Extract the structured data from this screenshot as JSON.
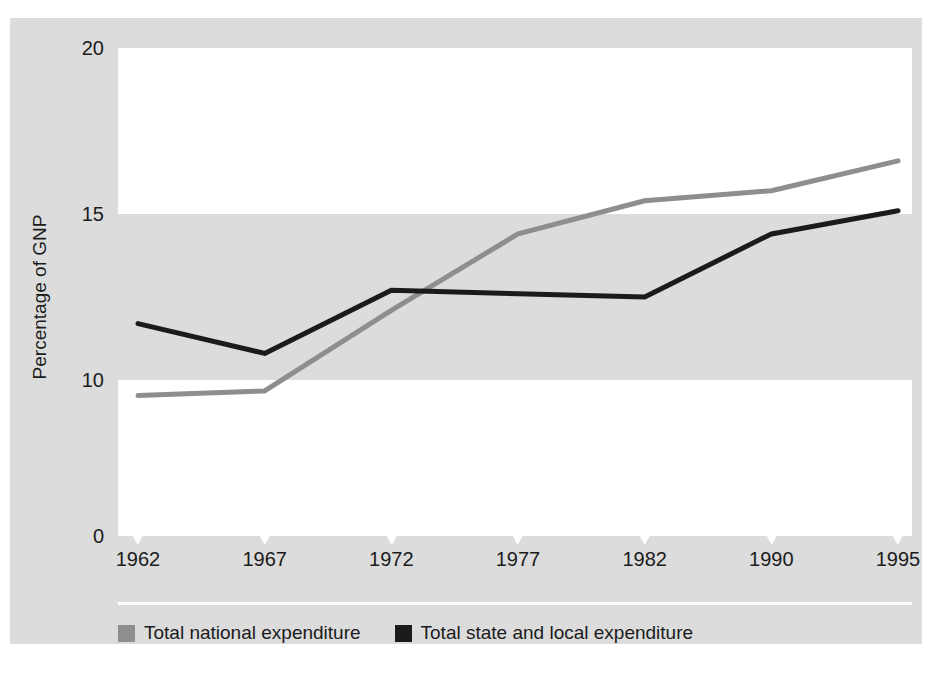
{
  "figure": {
    "top_cropped_caption": "",
    "bottom_cropped_caption": ""
  },
  "axes": {
    "y_title": "Percentage of GNP",
    "y_ticks": [
      "20",
      "15",
      "10",
      "0"
    ],
    "x_ticks": [
      "1962",
      "1967",
      "1972",
      "1977",
      "1982",
      "1990",
      "1995"
    ]
  },
  "legend": {
    "items": [
      {
        "label": "Total national expenditure",
        "color": "#8e8e8e"
      },
      {
        "label": "Total state and local expenditure",
        "color": "#1b1b1b"
      }
    ]
  },
  "colors": {
    "panel_background": "#dcdcdc",
    "band_white": "#ffffff",
    "national_line": "#8e8e8e",
    "state_local_line": "#1b1b1b",
    "text": "#1b1b1b"
  },
  "chart_data": {
    "type": "line",
    "title": "",
    "xlabel": "",
    "ylabel": "Percentage of GNP",
    "categories": [
      "1962",
      "1967",
      "1972",
      "1977",
      "1982",
      "1990",
      "1995"
    ],
    "ylim": [
      0,
      20
    ],
    "y_ticks": [
      0,
      10,
      15,
      20
    ],
    "y_axis_note": "broken scale: 0 to 10 compressed, 10 to 20 linear",
    "grid": false,
    "legend_position": "bottom-left",
    "background_bands": [
      {
        "from": 15,
        "to": 20,
        "color": "#ffffff"
      },
      {
        "from": 10,
        "to": 15,
        "color": "#dcdcdc"
      },
      {
        "from": 0,
        "to": 10,
        "color": "#ffffff"
      }
    ],
    "series": [
      {
        "name": "Total national expenditure",
        "color": "#8e8e8e",
        "values": [
          9.0,
          9.3,
          12.1,
          14.4,
          15.4,
          15.7,
          16.6
        ]
      },
      {
        "name": "Total state and local expenditure",
        "color": "#1b1b1b",
        "values": [
          11.7,
          10.8,
          12.7,
          12.6,
          12.5,
          14.4,
          15.1
        ]
      }
    ]
  }
}
